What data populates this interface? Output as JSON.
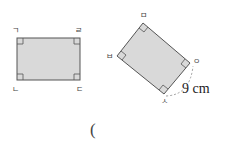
{
  "figure_left": {
    "shape": "rectangle",
    "labels": {
      "top_left": "ㄱ",
      "top_right": "ㄹ",
      "bottom_left": "ㄴ",
      "bottom_right": "ㄷ"
    },
    "fill": "#d9d9d9",
    "stroke": "#555555"
  },
  "figure_right": {
    "shape": "rectangle",
    "labels": {
      "top": "ㅁ",
      "left": "ㅂ",
      "bottom": "ㅅ",
      "right": "ㅇ"
    },
    "measure": "9 cm",
    "fill": "#d9d9d9",
    "stroke": "#555555"
  },
  "answer": {
    "open_paren": "("
  }
}
